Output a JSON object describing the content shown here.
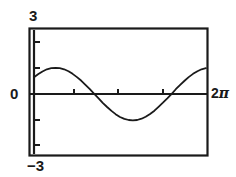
{
  "figure": {
    "kind": "graphing-calculator-plot",
    "background_color": "#ffffff",
    "ink_color": "#1a1a1a"
  },
  "labels": {
    "y_max": "3",
    "y_min": "−3",
    "y_zero": "0",
    "x_max": "2π",
    "x_max_number": "2",
    "x_max_symbol": "π"
  },
  "chart_data": {
    "type": "line",
    "title": "",
    "xlabel": "",
    "ylabel": "",
    "xlim": [
      0,
      6.283185
    ],
    "ylim": [
      -3,
      3
    ],
    "xtick_labels": [
      "0",
      "2π"
    ],
    "ytick_labels": [
      "−3",
      "0",
      "3"
    ],
    "grid": false,
    "legend": "none",
    "frame": "box",
    "x_axis_drawn_at_y": 0,
    "y_axis_drawn_at_x": 0,
    "y_tick_values": [
      -2.5,
      -1.5,
      0,
      1.5,
      2.5
    ],
    "x_tick_values": [
      1.5708,
      3.1416,
      4.7124
    ],
    "series": [
      {
        "name": "curve",
        "description": "phase-shifted sine, amplitude about 1.2",
        "x": [
          0.0,
          0.16,
          0.31,
          0.47,
          0.63,
          0.79,
          0.94,
          1.1,
          1.26,
          1.41,
          1.57,
          1.73,
          1.88,
          2.04,
          2.2,
          2.36,
          2.51,
          2.67,
          2.83,
          2.98,
          3.14,
          3.3,
          3.46,
          3.61,
          3.77,
          3.93,
          4.08,
          4.24,
          4.4,
          4.55,
          4.71,
          4.87,
          5.03,
          5.18,
          5.34,
          5.5,
          5.65,
          5.81,
          5.97,
          6.12,
          6.28
        ],
        "y": [
          0.77,
          0.92,
          1.04,
          1.14,
          1.19,
          1.21,
          1.19,
          1.14,
          1.05,
          0.93,
          0.78,
          0.61,
          0.42,
          0.22,
          0.01,
          -0.2,
          -0.41,
          -0.6,
          -0.78,
          -0.93,
          -1.06,
          -1.15,
          -1.2,
          -1.22,
          -1.2,
          -1.14,
          -1.05,
          -0.92,
          -0.77,
          -0.59,
          -0.4,
          -0.2,
          0.01,
          0.22,
          0.42,
          0.61,
          0.78,
          0.93,
          1.05,
          1.14,
          1.19
        ],
        "y_visible_clip": [
          -1.25,
          1.25
        ],
        "color": "#1a1a1a",
        "linewidth": 1.6,
        "peak": {
          "x": 0.87,
          "y": 1.21
        },
        "trough": {
          "x": 3.66,
          "y": 1.22,
          "y_signed": -1.22
        },
        "zero_crossings": [
          2.27,
          5.41
        ],
        "start_value": 0.77,
        "end_value": 0.55
      }
    ]
  }
}
